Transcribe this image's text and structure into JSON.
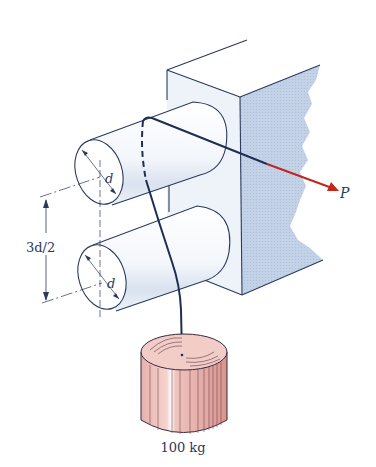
{
  "figure": {
    "labels": {
      "force": "P",
      "diameter_upper": "d",
      "diameter_lower": "d",
      "spacing": "3d/2",
      "mass": "100 kg"
    },
    "colors": {
      "line": "#2a3a5c",
      "rope": "#1f2d55",
      "force_arrow": "#c0281e",
      "wall_side": "#c9d6ea",
      "wall_front": "#eef3fa",
      "mass_top": "#f2cdc8",
      "mass_side": "#e9b3ae"
    }
  }
}
